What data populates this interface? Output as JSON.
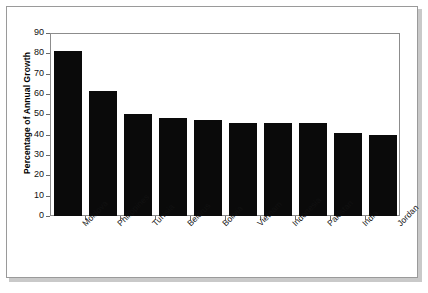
{
  "chart_data": {
    "type": "bar",
    "title": "",
    "xlabel": "",
    "ylabel": "Percentage of Annual Growth",
    "categories": [
      "Moldova",
      "Philippines",
      "Tunisia",
      "Belarus",
      "Bolivia",
      "Vietnam",
      "Indonesia",
      "Pakistan",
      "India",
      "Jordan"
    ],
    "values": [
      81,
      61.5,
      50,
      48,
      47,
      45.5,
      45.5,
      45.5,
      41,
      40
    ],
    "ylim": [
      0,
      90
    ],
    "yticks": [
      0,
      10,
      20,
      30,
      40,
      50,
      60,
      70,
      80,
      90
    ],
    "ytick_labels": [
      "0",
      "10",
      "20",
      "30",
      "40",
      "50",
      "60",
      "70",
      "80",
      "90"
    ],
    "grid": false,
    "legend": null,
    "bar_color": "#0a0a0a",
    "axis_color": "#8c8c8c",
    "frame_color": "#9a9a9a",
    "background": "#ffffff"
  }
}
